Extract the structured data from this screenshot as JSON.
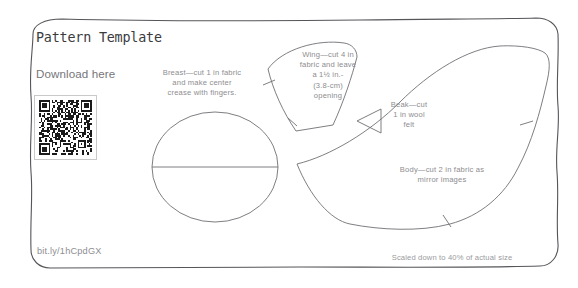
{
  "page": {
    "title": "Pattern Template",
    "download_label": "Download here",
    "short_url": "bit.ly/1hCpdGX",
    "scale_note": "Scaled down to 40% of actual size",
    "background_color": "#ffffff",
    "border_color": "#55555a",
    "text_color": "#8d8d90",
    "title_color": "#3b3b3e",
    "line_color": "#6f6f75"
  },
  "qr_code": {
    "name": "qr-code",
    "encodes": "bit.ly/1hCpdGX",
    "modules": 33,
    "foreground": "#1a1a1a",
    "background": "#ffffff"
  },
  "pattern_pieces": [
    {
      "id": "breast",
      "label": "Breast—cut 1 in fabric\nand make center\ncrease with fingers.",
      "shape": "circle-with-center-crease"
    },
    {
      "id": "wing",
      "label": "Wing—cut 4 in\nfabric and leave\na 1½ in.-\n(3.8-cm)\nopening",
      "shape": "curved-wedge-with-notches"
    },
    {
      "id": "beak",
      "label": "Beak—cut\n1 in wool\nfelt",
      "shape": "triangle-pointing-left"
    },
    {
      "id": "body",
      "label": "Body—cut 2 in fabric as\nmirror images",
      "shape": "bird-body-crescent-with-notches"
    }
  ]
}
